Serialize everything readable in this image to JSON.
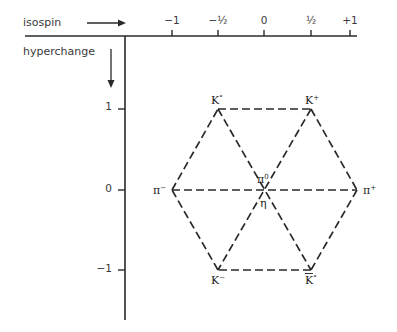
{
  "axes": {
    "x_label": "isospin",
    "y_label": "hyperchange",
    "x_ticks": [
      {
        "label": "−1",
        "value": -1
      },
      {
        "label": "−½",
        "value": -0.5
      },
      {
        "label": "0",
        "value": 0
      },
      {
        "label": "½",
        "value": 0.5
      },
      {
        "label": "+1",
        "value": 1
      }
    ],
    "y_ticks": [
      {
        "label": "1",
        "value": 1
      },
      {
        "label": "0",
        "value": 0
      },
      {
        "label": "−1",
        "value": -1
      }
    ]
  },
  "particles": [
    {
      "id": "K0",
      "base": "K",
      "sup": "°",
      "bar": false,
      "isospin": -0.5,
      "hypercharge": 1
    },
    {
      "id": "K+",
      "base": "K",
      "sup": "+",
      "bar": false,
      "isospin": 0.5,
      "hypercharge": 1
    },
    {
      "id": "pi-",
      "base": "π",
      "sup": "−",
      "bar": false,
      "isospin": -1,
      "hypercharge": 0
    },
    {
      "id": "pi0",
      "base": "π",
      "sup": "0",
      "bar": false,
      "isospin": 0,
      "hypercharge": 0
    },
    {
      "id": "pi+",
      "base": "π",
      "sup": "+",
      "bar": false,
      "isospin": 1,
      "hypercharge": 0
    },
    {
      "id": "eta",
      "base": "η",
      "sup": "",
      "bar": false,
      "isospin": 0,
      "hypercharge": 0
    },
    {
      "id": "K-",
      "base": "K",
      "sup": "−",
      "bar": false,
      "isospin": -0.5,
      "hypercharge": -1
    },
    {
      "id": "K0bar",
      "base": "K",
      "sup": "°",
      "bar": true,
      "isospin": 0.5,
      "hypercharge": -1
    }
  ],
  "colors": {
    "ink": "#2a2a2a",
    "background": "#ffffff"
  }
}
